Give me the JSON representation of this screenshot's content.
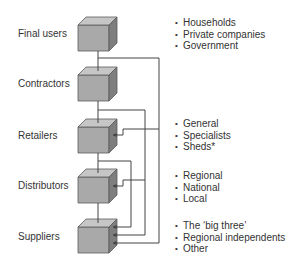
{
  "diagram": {
    "bullet_symbol": "•",
    "stages": [
      {
        "label": "Final users",
        "bullets": [
          "Households",
          "Private companies",
          "Government"
        ]
      },
      {
        "label": "Contractors",
        "bullets": []
      },
      {
        "label": "Retailers",
        "bullets": [
          "General",
          "Specialists",
          "Sheds*"
        ]
      },
      {
        "label": "Distributors",
        "bullets": [
          "Regional",
          "National",
          "Local"
        ]
      },
      {
        "label": "Suppliers",
        "bullets": [
          "The ‘big three’",
          "Regional independents",
          "Other"
        ]
      }
    ],
    "connections": [
      {
        "from": "Final users",
        "to": [
          "Retailers",
          "Suppliers"
        ]
      },
      {
        "from": "Contractors",
        "to": [
          "Distributors",
          "Suppliers"
        ]
      },
      {
        "from": "Retailers",
        "to": [
          "Suppliers"
        ]
      }
    ],
    "colors": {
      "cube_front": "#a9a9a9",
      "cube_top": "#c6c6c6",
      "cube_side": "#7e7e7e",
      "cube_edge": "#5a5a5a",
      "line": "#444444",
      "text": "#333333"
    }
  }
}
